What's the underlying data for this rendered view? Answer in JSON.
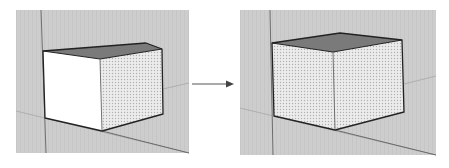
{
  "figure": {
    "colors": {
      "background": "#ffffff",
      "viewport": "#cfcfcf",
      "top_face": "#7a7a7a",
      "white_face": "#ffffff",
      "dotted_face_base": "#ececec",
      "dot": "#b5b5b5",
      "edge": "#222222",
      "axis_line": "#9a9a9a",
      "arrow": "#555555"
    },
    "panels": [
      {
        "id": "before",
        "label": "cube-before",
        "front_face_style": "plain-white",
        "side_face_style": "dotted"
      },
      {
        "id": "after",
        "label": "cube-after",
        "front_face_style": "dotted",
        "side_face_style": "dotted"
      }
    ],
    "arrow": {
      "direction": "right"
    }
  }
}
